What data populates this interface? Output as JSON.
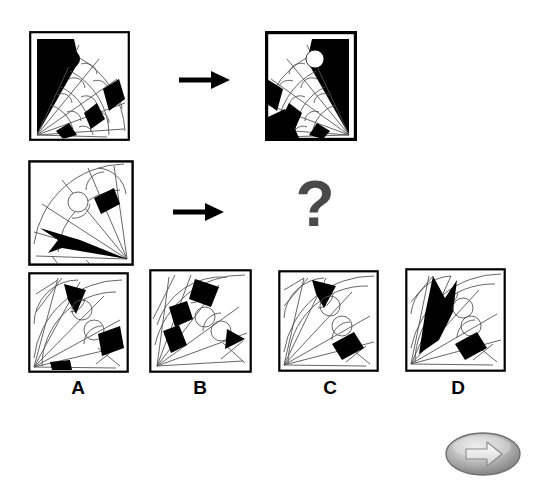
{
  "puzzle": {
    "type": "visual-analogy-matrix",
    "title": "Visual analogy puzzle",
    "instruction_symbol": "?",
    "question_mark": "?",
    "colors": {
      "ink": "#000000",
      "line": "#555555",
      "background": "#ffffff",
      "question_mark": "#4a4a4a",
      "button_face": "#b8b8b8",
      "button_edge": "#6f6f6f",
      "button_arrow": "#f2f2f2"
    },
    "rows": [
      {
        "name": "example-row",
        "source_panel": {
          "name": "row1-source",
          "description": "Fan of radiating spokes from bottom-left corner with black wedge at upper left, black filled circle, and black quadrilateral bands",
          "hub": "bottom-left",
          "black_circle": true,
          "white_circle": false
        },
        "arrow": "→",
        "result_panel": {
          "name": "row1-result",
          "description": "Mirrored fan radiating from bottom-right with black wedge containing white circle and black bands at lower left",
          "hub": "bottom-right",
          "black_circle": false,
          "white_circle": true
        }
      },
      {
        "name": "question-row",
        "source_panel": {
          "name": "row2-source",
          "description": "Fan radiating from bottom-right with black arrow wedge and black quadrilateral band, two outlined circles",
          "hub": "bottom-right",
          "black_circle": false,
          "white_circle": true
        },
        "arrow": "→",
        "result_panel": {
          "name": "row2-result",
          "description": "Unknown - represented by question mark"
        }
      }
    ],
    "options": [
      {
        "id": "A",
        "label": "A",
        "name": "option-a",
        "description": "Fan from bottom-left, black triangular wedge upper area, black band mid-right, small black wedge at bottom"
      },
      {
        "id": "B",
        "label": "B",
        "name": "option-b",
        "description": "Fan from bottom-left with checkered black bands upper-left and black triangle at right edge"
      },
      {
        "id": "C",
        "label": "C",
        "name": "option-c",
        "description": "Fan from bottom-left with black triangular wedge at top and single black band lower-right"
      },
      {
        "id": "D",
        "label": "D",
        "name": "option-d",
        "description": "Fan from bottom-left with large black arrow-shaped wedge and black band lower-right"
      }
    ],
    "navigation": {
      "next_button_label": "Next",
      "next_icon": "arrow-right-icon"
    }
  }
}
